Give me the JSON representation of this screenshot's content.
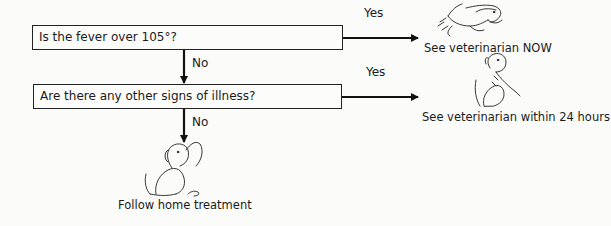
{
  "flowchart": {
    "questions": [
      {
        "id": "q1",
        "text": "Is the fever over 105°?"
      },
      {
        "id": "q2",
        "text": "Are there any other signs of illness?"
      }
    ],
    "edges": [
      {
        "from": "q1",
        "to": "outcome_now",
        "label": "Yes"
      },
      {
        "from": "q1",
        "to": "q2",
        "label": "No"
      },
      {
        "from": "q2",
        "to": "outcome_24h",
        "label": "Yes"
      },
      {
        "from": "q2",
        "to": "outcome_home",
        "label": "No"
      }
    ],
    "outcomes": {
      "now": {
        "text": "See veterinarian NOW",
        "icon": "running-dog-icon"
      },
      "within_24h": {
        "text": "See veterinarian within 24 hours",
        "icon": "sick-dog-icon"
      },
      "home": {
        "text": "Follow home treatment",
        "icon": "sitting-dog-icon"
      }
    },
    "labels": {
      "yes": "Yes",
      "no": "No"
    }
  },
  "colors": {
    "line": "#222222",
    "background": "#fbfbf9"
  }
}
